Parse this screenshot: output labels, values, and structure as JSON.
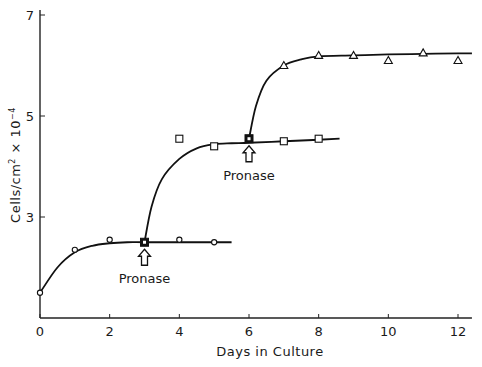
{
  "chart_data": {
    "type": "line",
    "title": "",
    "xlabel": "Days in Culture",
    "ylabel": "Cells/cm² × 10⁻⁴",
    "ylabel_parts": {
      "main": "Cells/cm",
      "sup1": "2",
      "mid": " × 10",
      "sup2": "−4"
    },
    "xlim": [
      0,
      12.4
    ],
    "ylim": [
      1,
      7.1
    ],
    "xticks": [
      0,
      2,
      4,
      6,
      8,
      10,
      12
    ],
    "yticks": [
      3,
      5,
      7
    ],
    "grid": false,
    "legend": null,
    "series": [
      {
        "name": "Initial culture",
        "marker": "circle",
        "x": [
          0,
          1,
          2,
          3,
          4,
          5
        ],
        "y": [
          1.5,
          2.35,
          2.55,
          2.5,
          2.55,
          2.5
        ],
        "curve_x": [
          0,
          0.5,
          1,
          1.5,
          2,
          2.5,
          3,
          4,
          5,
          5.5
        ],
        "curve_y": [
          1.5,
          2.0,
          2.3,
          2.43,
          2.48,
          2.5,
          2.5,
          2.5,
          2.5,
          2.5
        ]
      },
      {
        "name": "After first Pronase (day 3)",
        "marker": "square",
        "x": [
          4,
          5,
          6,
          7,
          8
        ],
        "y": [
          4.55,
          4.4,
          4.55,
          4.5,
          4.55
        ],
        "curve_x": [
          3,
          3.2,
          3.5,
          4,
          4.5,
          5,
          5.5,
          6,
          7,
          8,
          8.6
        ],
        "curve_y": [
          2.5,
          3.2,
          3.75,
          4.15,
          4.36,
          4.44,
          4.46,
          4.47,
          4.5,
          4.53,
          4.55
        ]
      },
      {
        "name": "After second Pronase (day 6)",
        "marker": "triangle",
        "x": [
          7,
          8,
          9,
          10,
          11,
          12
        ],
        "y": [
          6.0,
          6.2,
          6.2,
          6.1,
          6.25,
          6.1
        ],
        "curve_x": [
          6,
          6.2,
          6.5,
          7,
          7.5,
          8,
          9,
          10,
          11,
          12,
          12.4
        ],
        "curve_y": [
          4.55,
          5.2,
          5.7,
          6.0,
          6.12,
          6.18,
          6.2,
          6.22,
          6.23,
          6.24,
          6.24
        ]
      }
    ],
    "special_points": [
      {
        "x": 3,
        "y": 2.5,
        "marker": "filled-square"
      },
      {
        "x": 6,
        "y": 4.55,
        "marker": "filled-square"
      }
    ],
    "annotations": [
      {
        "text": "Pronase",
        "x": 3,
        "arrow": "up",
        "position": "below-curve"
      },
      {
        "text": "Pronase",
        "x": 6,
        "arrow": "up",
        "position": "below-curve"
      }
    ]
  }
}
